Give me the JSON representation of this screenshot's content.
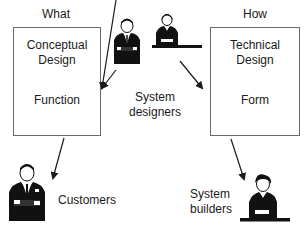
{
  "diagram": {
    "left_column": {
      "header": "What",
      "box_title_line1": "Conceptual",
      "box_title_line2": "Design",
      "box_subtitle": "Function"
    },
    "right_column": {
      "header": "How",
      "box_title_line1": "Technical",
      "box_title_line2": "Design",
      "box_subtitle": "Form"
    },
    "center": {
      "label_line1": "System",
      "label_line2": "designers"
    },
    "bottom_left": {
      "label": "Customers"
    },
    "bottom_right": {
      "label_line1": "System",
      "label_line2": "builders"
    },
    "icons": {
      "designer_standing": "businessman-arms-crossed-icon",
      "designer_seated": "person-at-desk-icon",
      "customer": "businessman-arms-crossed-icon",
      "builder": "person-at-desk-icon"
    },
    "colors": {
      "line": "#1a1a1a",
      "box_border": "#6a6a6a",
      "figure": "#111111",
      "background": "#ffffff"
    }
  }
}
